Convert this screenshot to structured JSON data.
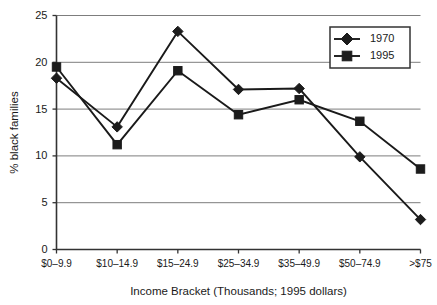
{
  "figure": {
    "scan_artifact_text": "",
    "background_color": "#ffffff",
    "line_color": "#1a1a1a",
    "grid_color": "#6e6e6e",
    "axis_color": "#333333"
  },
  "legend": {
    "position": "top-right",
    "entries": [
      {
        "label": "1970",
        "marker": "diamond-icon"
      },
      {
        "label": "1995",
        "marker": "square-icon"
      }
    ]
  },
  "chart_data": {
    "type": "line",
    "title": "",
    "xlabel": "Income Bracket (Thousands; 1995 dollars)",
    "ylabel": "% black families",
    "categories": [
      "$0–9.9",
      "$10–14.9",
      "$15–24.9",
      "$25–34.9",
      "$35–49.9",
      "$50–74.9",
      ">$75"
    ],
    "series": [
      {
        "name": "1970",
        "marker": "diamond",
        "values": [
          18.3,
          13.1,
          23.3,
          17.1,
          17.2,
          9.9,
          3.2
        ]
      },
      {
        "name": "1995",
        "marker": "square",
        "values": [
          19.5,
          11.2,
          19.1,
          14.4,
          16.0,
          13.7,
          8.6
        ]
      }
    ],
    "ylim": [
      0,
      25
    ],
    "yticks": [
      0,
      5,
      10,
      15,
      20,
      25
    ],
    "ytick_labels": [
      "0",
      "5",
      "10",
      "15",
      "20",
      "25"
    ],
    "grid": "horizontal",
    "legend_position": "top-right"
  }
}
